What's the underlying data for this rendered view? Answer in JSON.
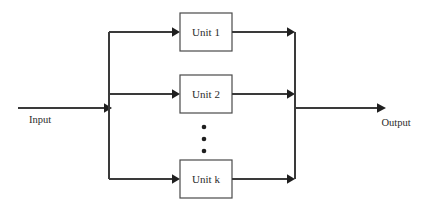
{
  "diagram": {
    "type": "block-diagram",
    "canvas": {
      "width": 424,
      "height": 209,
      "background": "#ffffff"
    },
    "style": {
      "line_color": "#3a3a3a",
      "box_stroke": "#4a4a4a",
      "box_fill": "#ffffff",
      "text_color": "#2b2b2b",
      "arrow_fill": "#1f1f1f"
    },
    "io": {
      "input_label": "Input",
      "output_label": "Output"
    },
    "units": [
      {
        "label": "Unit 1",
        "x": 180,
        "y": 13,
        "width": 52,
        "height": 38,
        "center_y": 32
      },
      {
        "label": "Unit 2",
        "x": 180,
        "y": 75,
        "width": 52,
        "height": 38,
        "center_y": 94
      },
      {
        "label": "Unit k",
        "x": 180,
        "y": 160,
        "width": 52,
        "height": 38,
        "center_y": 179
      }
    ],
    "ellipsis": {
      "name": "vertical-ellipsis",
      "count": 3,
      "x": 204,
      "ys": [
        127,
        139,
        151
      ],
      "radius": 2.2
    },
    "buses": {
      "input_bus_x": 109,
      "output_bus_x": 295,
      "bus_top_y": 32,
      "bus_bottom_y": 179
    },
    "lines": {
      "input_line": {
        "x1": 18,
        "y1": 108,
        "x2": 109,
        "y2": 108
      },
      "output_line": {
        "x1": 295,
        "y1": 108,
        "x2": 385,
        "y2": 108
      }
    },
    "labels": {
      "input_text_x": 40,
      "input_text_y": 123,
      "output_text_x": 396,
      "output_text_y": 126
    }
  }
}
